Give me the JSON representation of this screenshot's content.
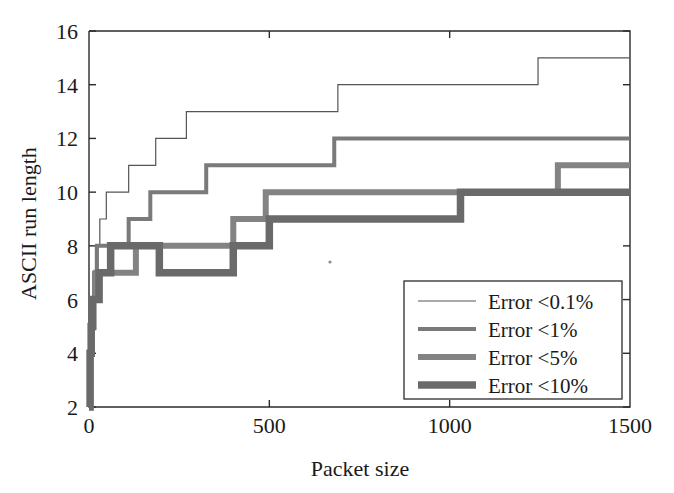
{
  "chart_data": {
    "type": "line",
    "variant": "step-post",
    "title": "",
    "xlabel": "Packet size",
    "ylabel": "ASCII run length",
    "xlim": [
      0,
      1500
    ],
    "ylim": [
      2,
      16
    ],
    "xticks": [
      0,
      500,
      1000,
      1500
    ],
    "yticks": [
      2,
      4,
      6,
      8,
      10,
      12,
      14,
      16
    ],
    "xtick_labels": [
      "0",
      "500",
      "1000",
      "1500"
    ],
    "ytick_labels": [
      "2",
      "4",
      "6",
      "8",
      "10",
      "12",
      "14",
      "16"
    ],
    "grid": false,
    "legend_position": "lower right",
    "background": "#ffffff",
    "series": [
      {
        "name": "Error <0.1%",
        "color": "#555555",
        "width": 1.2,
        "points": [
          {
            "x": 0,
            "y": 2
          },
          {
            "x": 6,
            "y": 4
          },
          {
            "x": 10,
            "y": 6
          },
          {
            "x": 14,
            "y": 7
          },
          {
            "x": 18,
            "y": 8
          },
          {
            "x": 30,
            "y": 9
          },
          {
            "x": 48,
            "y": 10
          },
          {
            "x": 110,
            "y": 11
          },
          {
            "x": 185,
            "y": 12
          },
          {
            "x": 270,
            "y": 13
          },
          {
            "x": 690,
            "y": 14
          },
          {
            "x": 1245,
            "y": 15
          },
          {
            "x": 1500,
            "y": 15
          }
        ]
      },
      {
        "name": "Error <1%",
        "color": "#7a7a7a",
        "width": 4.0,
        "points": [
          {
            "x": 0,
            "y": 2
          },
          {
            "x": 5,
            "y": 4
          },
          {
            "x": 9,
            "y": 6
          },
          {
            "x": 14,
            "y": 7
          },
          {
            "x": 22,
            "y": 8
          },
          {
            "x": 110,
            "y": 9
          },
          {
            "x": 170,
            "y": 10
          },
          {
            "x": 325,
            "y": 11
          },
          {
            "x": 680,
            "y": 12
          },
          {
            "x": 1500,
            "y": 12
          }
        ]
      },
      {
        "name": "Error <5%",
        "color": "#838383",
        "width": 6.0,
        "points": [
          {
            "x": 0,
            "y": 2
          },
          {
            "x": 4,
            "y": 4
          },
          {
            "x": 8,
            "y": 5
          },
          {
            "x": 12,
            "y": 6
          },
          {
            "x": 20,
            "y": 7
          },
          {
            "x": 130,
            "y": 8
          },
          {
            "x": 400,
            "y": 9
          },
          {
            "x": 490,
            "y": 10
          },
          {
            "x": 1300,
            "y": 11
          },
          {
            "x": 1500,
            "y": 11
          }
        ]
      },
      {
        "name": "Error <10%",
        "color": "#6a6a6a",
        "width": 7.5,
        "points": [
          {
            "x": 0,
            "y": 2
          },
          {
            "x": 3,
            "y": 4
          },
          {
            "x": 6,
            "y": 5
          },
          {
            "x": 10,
            "y": 6
          },
          {
            "x": 28,
            "y": 7
          },
          {
            "x": 60,
            "y": 8
          },
          {
            "x": 195,
            "y": 7
          },
          {
            "x": 400,
            "y": 8
          },
          {
            "x": 500,
            "y": 9
          },
          {
            "x": 1030,
            "y": 10
          },
          {
            "x": 1500,
            "y": 10
          }
        ]
      }
    ],
    "legend_entries": [
      {
        "label": "Error <0.1%",
        "color": "#555555",
        "width": 1.2
      },
      {
        "label": "Error <1%",
        "color": "#7a7a7a",
        "width": 4.0
      },
      {
        "label": "Error <5%",
        "color": "#838383",
        "width": 6.0
      },
      {
        "label": "Error <10%",
        "color": "#6a6a6a",
        "width": 7.5
      }
    ]
  }
}
